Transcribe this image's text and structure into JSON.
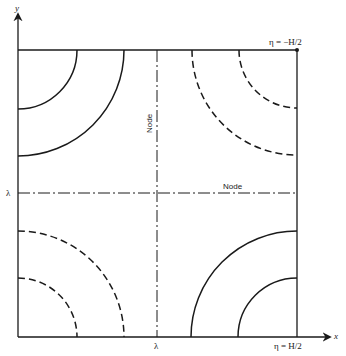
{
  "diagram": {
    "axes": {
      "x_label": "x",
      "y_label": "y",
      "x_tick_label": "λ",
      "y_tick_label": "λ"
    },
    "boundary_labels": {
      "top": "η = −H/2",
      "bottom": "η = H/2"
    },
    "node_lines": {
      "vertical_label": "Node",
      "horizontal_label": "Node"
    },
    "contours": [
      {
        "quadrant": "top-left",
        "style": "solid",
        "radii": [
          59,
          106
        ]
      },
      {
        "quadrant": "top-right",
        "style": "dashed",
        "radii": [
          58,
          105
        ]
      },
      {
        "quadrant": "bottom-left",
        "style": "dashed",
        "radii": [
          59,
          106
        ]
      },
      {
        "quadrant": "bottom-right",
        "style": "solid",
        "radii": [
          59,
          106
        ]
      }
    ],
    "colors": {
      "line": "#1a1a1a",
      "background": "#ffffff"
    }
  }
}
